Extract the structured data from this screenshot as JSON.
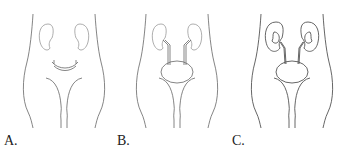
{
  "figure": {
    "stroke_color": "#555555",
    "panels": [
      {
        "label": "A.",
        "content": "kidneys with crescent-shaped bladder precursor"
      },
      {
        "label": "B.",
        "content": "kidneys with ureters and bladder"
      },
      {
        "label": "C.",
        "content": "developed kidneys with renal pelvis, ureters and bladder"
      }
    ]
  }
}
